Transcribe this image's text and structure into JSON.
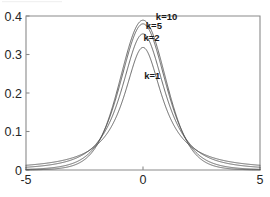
{
  "chart_data": {
    "type": "line",
    "title": "",
    "subtitle": "",
    "xlabel": "",
    "ylabel": "",
    "xlim": [
      -5,
      5
    ],
    "ylim": [
      0,
      0.4
    ],
    "xticks": [
      -5,
      0,
      5
    ],
    "xtick_labels": [
      "-5",
      "0",
      "5"
    ],
    "yticks": [
      0,
      0.1,
      0.2,
      0.3,
      0.4
    ],
    "ytick_labels": [
      "0",
      "0.1",
      "0.2",
      "0.3",
      "0.4"
    ],
    "grid": false,
    "legend_position": "inline-annotations",
    "line_color": "#4a4a4a",
    "axis_color": "#8a8a8a",
    "background_color": "#ffffff",
    "x": [
      -5,
      -4.75,
      -4.5,
      -4.25,
      -4,
      -3.75,
      -3.5,
      -3.25,
      -3,
      -2.75,
      -2.5,
      -2.25,
      -2,
      -1.75,
      -1.5,
      -1.25,
      -1,
      -0.75,
      -0.5,
      -0.25,
      0,
      0.25,
      0.5,
      0.75,
      1,
      1.25,
      1.5,
      1.75,
      2,
      2.25,
      2.5,
      2.75,
      3,
      3.25,
      3.5,
      3.75,
      4,
      4.25,
      4.5,
      4.75,
      5
    ],
    "series": [
      {
        "name": "k=1",
        "label": "k=1",
        "peak_value": 0.3183,
        "values": [
          0.0122,
          0.0135,
          0.015,
          0.0167,
          0.0187,
          0.0211,
          0.024,
          0.0275,
          0.0318,
          0.0372,
          0.0439,
          0.0525,
          0.0637,
          0.0784,
          0.0979,
          0.124,
          0.1592,
          0.2037,
          0.2546,
          0.2995,
          0.3183,
          0.2995,
          0.2546,
          0.2037,
          0.1592,
          0.124,
          0.0979,
          0.0784,
          0.0637,
          0.0525,
          0.0439,
          0.0372,
          0.0318,
          0.0275,
          0.024,
          0.0211,
          0.0187,
          0.0167,
          0.015,
          0.0135,
          0.0122
        ]
      },
      {
        "name": "k=2",
        "label": "k=2",
        "peak_value": 0.3536,
        "values": [
          0.0065,
          0.0075,
          0.0088,
          0.0103,
          0.0123,
          0.0147,
          0.0177,
          0.0216,
          0.0269,
          0.0338,
          0.0433,
          0.0566,
          0.0751,
          0.1009,
          0.1361,
          0.1821,
          0.1924,
          0.2416,
          0.2962,
          0.3385,
          0.3536,
          0.3385,
          0.2962,
          0.2416,
          0.1924,
          0.1821,
          0.1361,
          0.1009,
          0.0751,
          0.0566,
          0.0433,
          0.0338,
          0.0269,
          0.0216,
          0.0177,
          0.0147,
          0.0123,
          0.0103,
          0.0088,
          0.0075,
          0.0065
        ]
      },
      {
        "name": "k=5",
        "label": "k=5",
        "peak_value": 0.3796,
        "values": [
          0.002,
          0.0025,
          0.0032,
          0.0042,
          0.0055,
          0.0073,
          0.0097,
          0.0131,
          0.0179,
          0.0247,
          0.0345,
          0.0487,
          0.0651,
          0.0938,
          0.1245,
          0.1748,
          0.2197,
          0.2726,
          0.3279,
          0.3672,
          0.3796,
          0.3672,
          0.3279,
          0.2726,
          0.2197,
          0.1748,
          0.1245,
          0.0938,
          0.0651,
          0.0487,
          0.0345,
          0.0247,
          0.0179,
          0.0131,
          0.0097,
          0.0073,
          0.0055,
          0.0042,
          0.0032,
          0.0025,
          0.002
        ]
      },
      {
        "name": "k=10",
        "label": "k=10",
        "peak_value": 0.3891,
        "values": [
          0.0011,
          0.0014,
          0.0019,
          0.0026,
          0.0037,
          0.0052,
          0.0075,
          0.0108,
          0.0157,
          0.023,
          0.0339,
          0.0501,
          0.0651,
          0.0986,
          0.1272,
          0.1806,
          0.2304,
          0.283,
          0.3377,
          0.3761,
          0.3891,
          0.3761,
          0.3377,
          0.283,
          0.2304,
          0.1806,
          0.1272,
          0.0986,
          0.0651,
          0.0501,
          0.0339,
          0.023,
          0.0157,
          0.0108,
          0.0075,
          0.0052,
          0.0037,
          0.0026,
          0.0019,
          0.0014,
          0.0011
        ]
      }
    ],
    "annotations": [
      {
        "text": "k=10",
        "x": 0.55,
        "y": 0.4
      },
      {
        "text": "k=5",
        "x": 0.12,
        "y": 0.375
      },
      {
        "text": "k=2",
        "x": 0.02,
        "y": 0.345
      },
      {
        "text": "k=1",
        "x": 0.05,
        "y": 0.245
      }
    ]
  }
}
